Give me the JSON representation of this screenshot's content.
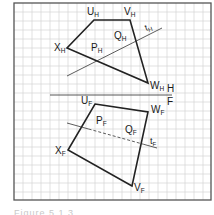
{
  "figure": {
    "grid": {
      "x": 14,
      "y": 3,
      "width": 197,
      "height": 197,
      "cell": 9,
      "line_color": "#d4d4d4",
      "border_color": "#555555"
    },
    "fold_line": {
      "x1": 50,
      "y1": 95,
      "x2": 172,
      "y2": 95,
      "label_above": "H",
      "label_below": "F"
    },
    "top_view": {
      "vertices": [
        {
          "name": "U",
          "sub": "H",
          "x": 94,
          "y": 20
        },
        {
          "name": "V",
          "sub": "H",
          "x": 130,
          "y": 20
        },
        {
          "name": "W",
          "sub": "H",
          "x": 148,
          "y": 83
        },
        {
          "name": "X",
          "sub": "H",
          "x": 67,
          "y": 48
        }
      ],
      "line_t": {
        "name": "t",
        "sub": "H",
        "x1": 67,
        "y1": 76,
        "x2": 162,
        "y2": 28
      },
      "points": [
        {
          "name": "P",
          "sub": "H"
        },
        {
          "name": "Q",
          "sub": "H"
        }
      ]
    },
    "front_view": {
      "vertices": [
        {
          "name": "U",
          "sub": "F",
          "x": 95,
          "y": 104
        },
        {
          "name": "W",
          "sub": "F",
          "x": 148,
          "y": 112
        },
        {
          "name": "V",
          "sub": "F",
          "x": 132,
          "y": 186
        },
        {
          "name": "X",
          "sub": "F",
          "x": 68,
          "y": 150
        }
      ],
      "line_t": {
        "name": "t",
        "sub": "F",
        "x1": 67,
        "y1": 123,
        "x2": 157,
        "y2": 148
      },
      "points": [
        {
          "name": "P",
          "sub": "F"
        },
        {
          "name": "Q",
          "sub": "F"
        }
      ]
    },
    "caption": "Figure 5.1.3"
  }
}
